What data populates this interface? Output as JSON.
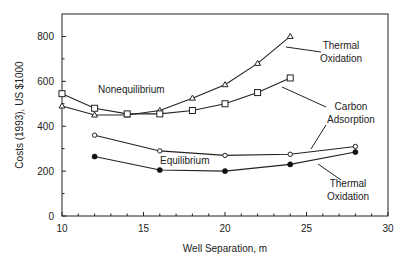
{
  "chart_data": {
    "type": "line",
    "title": "",
    "xlabel": "Well Separation, m",
    "ylabel": "Costs (1993), US $1000",
    "xlim": [
      10,
      30
    ],
    "ylim": [
      0,
      900
    ],
    "xticks": [
      10,
      15,
      20,
      25,
      30
    ],
    "yticks": [
      0,
      200,
      400,
      600,
      800
    ],
    "grid": false,
    "legend": "inline annotations",
    "group_labels": [
      "Nonequilibrium",
      "Equilibrium"
    ],
    "series": [
      {
        "name": "Nonequilibrium - Thermal Oxidation",
        "group": "Nonequilibrium",
        "marker": "open-triangle",
        "x": [
          10,
          12,
          14,
          16,
          18,
          20,
          22,
          24
        ],
        "values": [
          490,
          450,
          450,
          470,
          525,
          585,
          680,
          800
        ]
      },
      {
        "name": "Nonequilibrium - Carbon Adsorption",
        "group": "Nonequilibrium",
        "marker": "open-square",
        "x": [
          10,
          12,
          14,
          16,
          18,
          20,
          22,
          24
        ],
        "values": [
          545,
          480,
          455,
          455,
          470,
          500,
          550,
          615
        ]
      },
      {
        "name": "Equilibrium - Carbon Adsorption",
        "group": "Equilibrium",
        "marker": "open-circle",
        "x": [
          12,
          16,
          20,
          24,
          28
        ],
        "values": [
          360,
          290,
          270,
          275,
          310
        ]
      },
      {
        "name": "Equilibrium - Thermal Oxidation",
        "group": "Equilibrium",
        "marker": "filled-circle",
        "x": [
          12,
          16,
          20,
          24,
          28
        ],
        "values": [
          265,
          205,
          200,
          230,
          285
        ]
      }
    ],
    "annotations": [
      {
        "text": [
          "Thermal",
          "Oxidation"
        ],
        "points_to": "Nonequilibrium - Thermal Oxidation"
      },
      {
        "text": [
          "Carbon",
          "Adsorption"
        ],
        "points_to": "Carbon Adsorption (both groups)"
      },
      {
        "text": [
          "Thermal",
          "Oxidation"
        ],
        "points_to": "Equilibrium - Thermal Oxidation"
      }
    ]
  },
  "labels": {
    "nonequilibrium": "Nonequilibrium",
    "equilibrium": "Equilibrium",
    "ann1_l1": "Thermal",
    "ann1_l2": "Oxidation",
    "ann2_l1": "Carbon",
    "ann2_l2": "Adsorption",
    "ann3_l1": "Thermal",
    "ann3_l2": "Oxidation"
  }
}
